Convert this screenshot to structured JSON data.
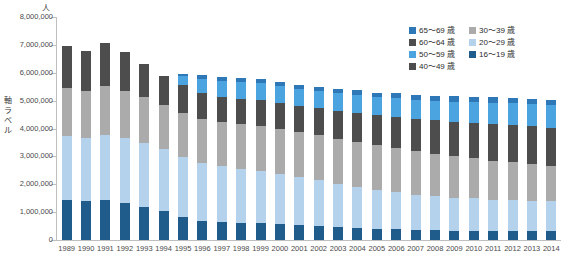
{
  "chart_data": {
    "type": "bar",
    "stacked": true,
    "title": "",
    "subtitle": "",
    "unit_label": "人",
    "ylabel": "軸ラベル",
    "xlabel": "",
    "grid": false,
    "legend_position": "top-right",
    "ylim": [
      0,
      8000000
    ],
    "ytick_step": 1000000,
    "ytick_labels": [
      "8,000,000",
      "7,000,000",
      "6,000,000",
      "5,000,000",
      "4,000,000",
      "3,000,000",
      "2,000,000",
      "1,000,000",
      "0"
    ],
    "ytick_values": [
      8000000,
      7000000,
      6000000,
      5000000,
      4000000,
      3000000,
      2000000,
      1000000,
      0
    ],
    "categories": [
      "1989",
      "1990",
      "1991",
      "1992",
      "1993",
      "1994",
      "1995",
      "1996",
      "1997",
      "1998",
      "1999",
      "2000",
      "2001",
      "2002",
      "2003",
      "2004",
      "2005",
      "2006",
      "2007",
      "2008",
      "2009",
      "2010",
      "2011",
      "2012",
      "2013",
      "2014"
    ],
    "series": [
      {
        "name": "16～19 歳",
        "color": "#1F5C8B",
        "values": [
          1420000,
          1400000,
          1450000,
          1330000,
          1200000,
          1030000,
          840000,
          700000,
          640000,
          620000,
          600000,
          570000,
          540000,
          500000,
          460000,
          430000,
          400000,
          380000,
          360000,
          350000,
          340000,
          340000,
          330000,
          330000,
          330000,
          330000
        ]
      },
      {
        "name": "20～29 歳",
        "color": "#B5D2EC",
        "values": [
          2300000,
          2260000,
          2330000,
          2320000,
          2280000,
          2220000,
          2150000,
          2080000,
          2000000,
          1940000,
          1880000,
          1800000,
          1720000,
          1640000,
          1560000,
          1480000,
          1400000,
          1340000,
          1270000,
          1220000,
          1180000,
          1150000,
          1120000,
          1100000,
          1080000,
          1060000
        ]
      },
      {
        "name": "30～39 歳",
        "color": "#ABABAB",
        "values": [
          1750000,
          1700000,
          1730000,
          1700000,
          1640000,
          1600000,
          1580000,
          1570000,
          1580000,
          1600000,
          1620000,
          1620000,
          1620000,
          1620000,
          1620000,
          1620000,
          1600000,
          1580000,
          1550000,
          1520000,
          1480000,
          1440000,
          1400000,
          1360000,
          1320000,
          1280000
        ]
      },
      {
        "name": "40～49 歳",
        "color": "#4D4D4D",
        "values": [
          1480000,
          1420000,
          1560000,
          1400000,
          1180000,
          1050000,
          980000,
          940000,
          920000,
          910000,
          910000,
          920000,
          940000,
          960000,
          1000000,
          1040000,
          1080000,
          1120000,
          1160000,
          1200000,
          1240000,
          1280000,
          1320000,
          1340000,
          1350000,
          1360000
        ]
      },
      {
        "name": "50～59 歳",
        "color": "#4BA3DF",
        "values": [
          0,
          0,
          0,
          0,
          0,
          0,
          320000,
          500000,
          560000,
          590000,
          610000,
          600000,
          600000,
          610000,
          620000,
          630000,
          640000,
          660000,
          680000,
          700000,
          720000,
          740000,
          760000,
          780000,
          790000,
          800000
        ]
      },
      {
        "name": "65～69 歳",
        "color": "#2E78B8",
        "values": [
          0,
          0,
          0,
          0,
          0,
          0,
          70000,
          120000,
          140000,
          150000,
          160000,
          160000,
          160000,
          160000,
          160000,
          170000,
          170000,
          180000,
          180000,
          190000,
          190000,
          200000,
          200000,
          200000,
          200000,
          200000
        ]
      }
    ],
    "legend_entries": [
      {
        "label": "65～69 歳",
        "color": "#2E78B8"
      },
      {
        "label": "30～39 歳",
        "color": "#ABABAB"
      },
      {
        "label": "60～64 歳",
        "color": "#4D4D4D"
      },
      {
        "label": "20～29 歳",
        "color": "#B5D2EC"
      },
      {
        "label": "50～59 歳",
        "color": "#4BA3DF"
      },
      {
        "label": "16～19 歳",
        "color": "#1F5C8B"
      },
      {
        "label": "40～49 歳",
        "color": "#4D4D4D"
      }
    ],
    "legend_order": [
      "65～69 歳",
      "30～39 歳",
      "60～64 歳",
      "20～29 歳",
      "50～59 歳",
      "16～19 歳",
      "40～49 歳"
    ],
    "colors": {
      "axis": "#bfbfbf",
      "text": "#4a4a4a",
      "background": "#ffffff"
    }
  }
}
